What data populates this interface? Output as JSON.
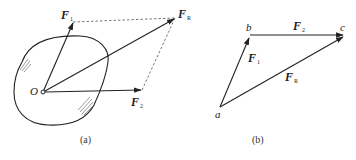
{
  "figure_a": {
    "caption": "(a)",
    "origin_label": "O",
    "forces": [
      {
        "symbol": "F",
        "subscript": "1"
      },
      {
        "symbol": "F",
        "subscript": "2"
      },
      {
        "symbol": "F",
        "subscript": "R"
      }
    ],
    "method": "parallelogram"
  },
  "figure_b": {
    "caption": "(b)",
    "points": [
      "a",
      "b",
      "c"
    ],
    "forces": [
      {
        "symbol": "F",
        "subscript": "1"
      },
      {
        "symbol": "F",
        "subscript": "2"
      },
      {
        "symbol": "F",
        "subscript": "R"
      }
    ],
    "method": "triangle"
  },
  "colors": {
    "line": "#222222",
    "dashed": "#555555",
    "background": "#ffffff"
  }
}
